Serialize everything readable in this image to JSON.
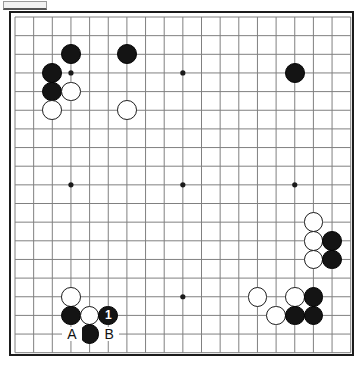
{
  "diagram": {
    "type": "go-board",
    "board_size": 19,
    "origin_x": 4,
    "origin_y": 4,
    "cell": 18.65,
    "colors": {
      "board_background": "#ffffff",
      "grid_line": "#808080",
      "border": "#1b1b1b",
      "black_stone": "#141414",
      "white_stone": "#ffffff",
      "white_stone_outline": "#1b1b1b",
      "label_text": "#111111",
      "number_text": "#ffffff",
      "tab_fill": "#f2f2f2",
      "tab_border": "#9a9a9a"
    },
    "star_points": [
      {
        "col": 3,
        "row": 3
      },
      {
        "col": 9,
        "row": 3
      },
      {
        "col": 15,
        "row": 3
      },
      {
        "col": 3,
        "row": 9
      },
      {
        "col": 9,
        "row": 9
      },
      {
        "col": 15,
        "row": 9
      },
      {
        "col": 3,
        "row": 15
      },
      {
        "col": 9,
        "row": 15
      },
      {
        "col": 15,
        "row": 15
      }
    ],
    "stones": [
      {
        "col": 3,
        "row": 2,
        "color": "black"
      },
      {
        "col": 6,
        "row": 2,
        "color": "black"
      },
      {
        "col": 2,
        "row": 3,
        "color": "black"
      },
      {
        "col": 15,
        "row": 3,
        "color": "black"
      },
      {
        "col": 2,
        "row": 4,
        "color": "black"
      },
      {
        "col": 3,
        "row": 4,
        "color": "white"
      },
      {
        "col": 2,
        "row": 5,
        "color": "white"
      },
      {
        "col": 6,
        "row": 5,
        "color": "white"
      },
      {
        "col": 16,
        "row": 11,
        "color": "white"
      },
      {
        "col": 16,
        "row": 12,
        "color": "white"
      },
      {
        "col": 17,
        "row": 12,
        "color": "black"
      },
      {
        "col": 16,
        "row": 13,
        "color": "white"
      },
      {
        "col": 17,
        "row": 13,
        "color": "black"
      },
      {
        "col": 3,
        "row": 15,
        "color": "white"
      },
      {
        "col": 13,
        "row": 15,
        "color": "white"
      },
      {
        "col": 15,
        "row": 15,
        "color": "white"
      },
      {
        "col": 16,
        "row": 15,
        "color": "black"
      },
      {
        "col": 3,
        "row": 16,
        "color": "black"
      },
      {
        "col": 4,
        "row": 16,
        "color": "white"
      },
      {
        "col": 14,
        "row": 16,
        "color": "white"
      },
      {
        "col": 15,
        "row": 16,
        "color": "black"
      },
      {
        "col": 16,
        "row": 16,
        "color": "black"
      },
      {
        "col": 5,
        "row": 16,
        "color": "black",
        "number": "1"
      },
      {
        "col": 4,
        "row": 17,
        "color": "black"
      }
    ],
    "point_labels": [
      {
        "col": 3,
        "row": 17,
        "text": "A"
      },
      {
        "col": 5,
        "row": 17,
        "text": "B"
      }
    ]
  }
}
